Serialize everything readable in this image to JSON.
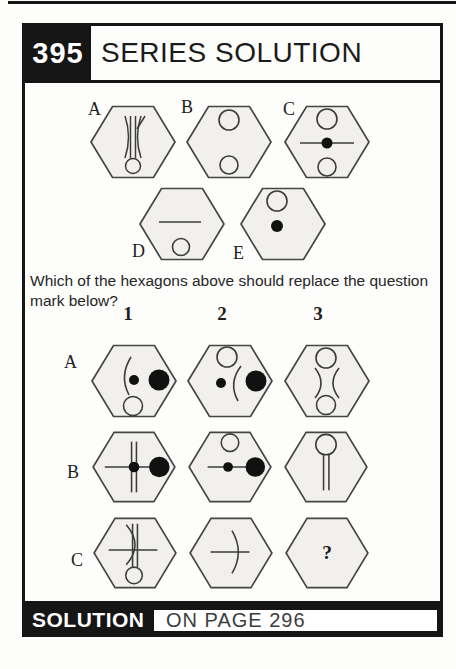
{
  "header": {
    "puzzle_number": "395",
    "title": "SERIES SOLUTION"
  },
  "question_text": "Which of the hexagons above should replace the question mark below?",
  "answer_options": [
    {
      "label": "A",
      "symbols": "double vertical lines flanked by facing curves, open circle at bottom"
    },
    {
      "label": "B",
      "symbols": "open circle at top, open circle at bottom"
    },
    {
      "label": "C",
      "symbols": "open circle at top, horizontal line with filled dot at centre, open circle at bottom"
    },
    {
      "label": "D",
      "symbols": "horizontal line at middle, open circle at bottom"
    },
    {
      "label": "E",
      "symbols": "open circle at top, filled dot at middle"
    }
  ],
  "grid": {
    "column_headers": [
      "1",
      "2",
      "3"
    ],
    "row_labels": [
      "A",
      "B",
      "C"
    ],
    "cells": [
      [
        "left-bulging curve with filled dot, large filled circle at right, open circle at bottom",
        "open circle at top, curve with filled dot at left, large filled circle at right",
        "open circle at top, two facing curves, open circle at bottom"
      ],
      [
        "horizontal line crossed by double vertical lines, filled dot at crossing, large filled circle at right",
        "open circle at top, horizontal line with filled dot, large filled circle at right",
        "open circle at top joined to double vertical stem"
      ],
      [
        "double vertical lines with crossing curve, horizontal line, open circle at bottom",
        "horizontal line crossed by right-bulging curve",
        "question mark"
      ]
    ],
    "question_mark": "?"
  },
  "footer": {
    "solution_label": "SOLUTION",
    "page_reference": "ON PAGE 296"
  },
  "colors": {
    "frame": "#151515",
    "hexagon_fill": "#f1f0ed",
    "stroke": "#454545",
    "page_bg": "#fdfdfb"
  }
}
